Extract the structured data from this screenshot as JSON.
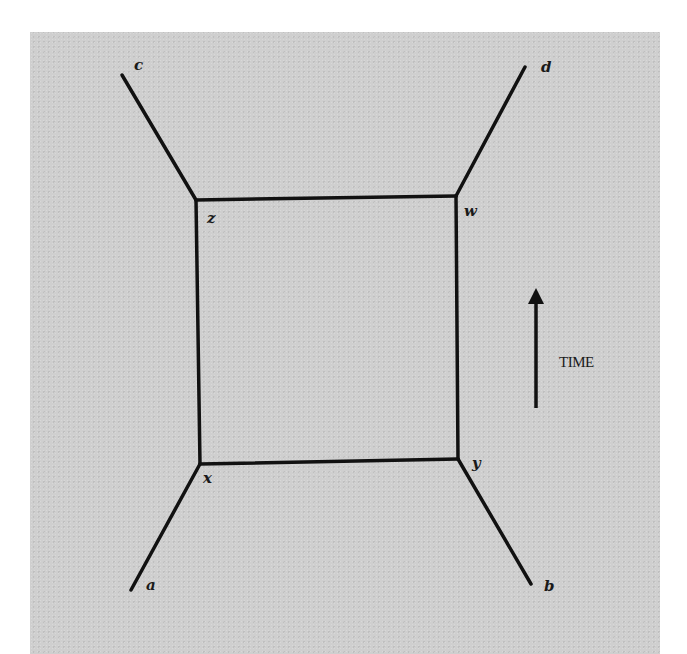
{
  "diagram": {
    "type": "feynman-box-diagram",
    "colors": {
      "background": "#cfcfcf",
      "line": "#111111",
      "text": "#1a1a1a"
    },
    "nodes": [
      {
        "id": "c",
        "label": "c",
        "x": 122,
        "y": 73,
        "role": "external"
      },
      {
        "id": "d",
        "label": "d",
        "x": 526,
        "y": 65,
        "role": "external"
      },
      {
        "id": "z",
        "label": "z",
        "x": 196,
        "y": 200,
        "role": "vertex"
      },
      {
        "id": "w",
        "label": "w",
        "x": 456,
        "y": 196,
        "role": "vertex"
      },
      {
        "id": "x",
        "label": "x",
        "x": 200,
        "y": 464,
        "role": "vertex"
      },
      {
        "id": "y",
        "label": "y",
        "x": 458,
        "y": 459,
        "role": "vertex"
      },
      {
        "id": "a",
        "label": "a",
        "x": 130,
        "y": 592,
        "role": "external"
      },
      {
        "id": "b",
        "label": "b",
        "x": 532,
        "y": 585,
        "role": "external"
      }
    ],
    "edges": [
      [
        "c",
        "z"
      ],
      [
        "d",
        "w"
      ],
      [
        "z",
        "w"
      ],
      [
        "z",
        "x"
      ],
      [
        "w",
        "y"
      ],
      [
        "x",
        "y"
      ],
      [
        "a",
        "x"
      ],
      [
        "b",
        "y"
      ]
    ],
    "labels": {
      "c": "c",
      "d": "d",
      "z": "z",
      "w": "w",
      "x": "x",
      "y": "y",
      "a": "a",
      "b": "b"
    },
    "time_axis": {
      "label": "TIME",
      "direction": "up",
      "arrow-icon": "arrow-up-icon"
    }
  }
}
